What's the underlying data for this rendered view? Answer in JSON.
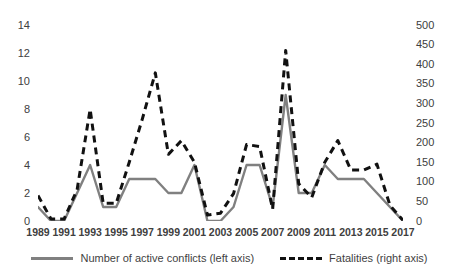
{
  "chart_data": {
    "type": "line",
    "title": "",
    "xlabel": "",
    "ylabel": "",
    "grid": false,
    "legend_position": "bottom",
    "x": [
      1989,
      1990,
      1991,
      1992,
      1993,
      1994,
      1995,
      1996,
      1997,
      1998,
      1999,
      2000,
      2001,
      2002,
      2003,
      2004,
      2005,
      2006,
      2007,
      2008,
      2009,
      2010,
      2011,
      2012,
      2013,
      2014,
      2015,
      2016,
      2017
    ],
    "x_tick_labels": [
      "1989",
      "1991",
      "1993",
      "1995",
      "1997",
      "1999",
      "2001",
      "2003",
      "2005",
      "2007",
      "2009",
      "2011",
      "2013",
      "2015",
      "2017"
    ],
    "axes": {
      "left": {
        "label": "Number of active conflicts",
        "ticks": [
          0,
          2,
          4,
          6,
          8,
          10,
          12,
          14
        ],
        "ylim": [
          0,
          14
        ]
      },
      "right": {
        "label": "Fatalities",
        "ticks": [
          0,
          50,
          100,
          150,
          200,
          250,
          300,
          350,
          400,
          450,
          500
        ],
        "ylim": [
          0,
          500
        ]
      }
    },
    "series": [
      {
        "name": "Number of active conflicts (left axis)",
        "axis": "left",
        "style": "solid",
        "color": "#808080",
        "values": [
          1,
          0,
          0,
          2,
          4,
          1,
          1,
          3,
          3,
          3,
          2,
          2,
          4,
          0,
          0,
          1,
          4,
          4,
          1,
          9,
          2,
          2,
          4,
          3,
          3,
          3,
          2,
          1,
          0
        ]
      },
      {
        "name": "Fatalities (right axis)",
        "axis": "right",
        "style": "dashed",
        "color": "#111111",
        "values": [
          65,
          5,
          5,
          80,
          285,
          45,
          45,
          150,
          260,
          378,
          170,
          205,
          150,
          15,
          20,
          70,
          195,
          190,
          30,
          435,
          95,
          60,
          150,
          205,
          130,
          130,
          145,
          40,
          2
        ]
      }
    ]
  },
  "legend": {
    "items": [
      {
        "label": "Number of active conflicts (left axis)",
        "marker": "solid-line-swatch"
      },
      {
        "label": "Fatalities (right axis)",
        "marker": "dashed-line-swatch"
      }
    ]
  }
}
